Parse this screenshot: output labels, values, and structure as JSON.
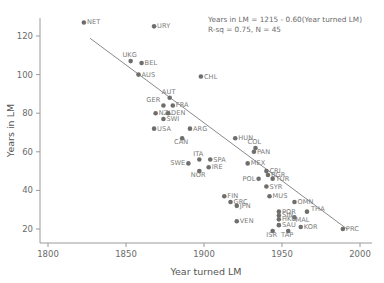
{
  "chart_data": {
    "type": "scatter",
    "title": "",
    "xlabel": "Year turned LM",
    "ylabel": "Years in LM",
    "xlim": [
      1790,
      2005
    ],
    "ylim": [
      13,
      132
    ],
    "xticks": [
      1800,
      1850,
      1900,
      1950,
      2000
    ],
    "xticklabels": [
      "1800",
      "1850",
      "1900",
      "1950",
      "2000"
    ],
    "yticks": [
      20,
      40,
      60,
      80,
      100,
      120
    ],
    "yticklabels": [
      "20",
      "40",
      "60",
      "80",
      "100",
      "120"
    ],
    "grid": false,
    "legend": null,
    "annotations": [
      "Years in LM = 1215 - 0.60(Year turned LM)",
      "R-sq = 0.75, N = 45"
    ],
    "fit_line": {
      "slope": -0.6,
      "intercept": 1215,
      "x_start": 1827,
      "x_end": 1992
    },
    "points": [
      {
        "label": "NET",
        "x": 1823,
        "y": 127,
        "lx": 3,
        "ly": 2
      },
      {
        "label": "URY",
        "x": 1868,
        "y": 125,
        "lx": 3,
        "ly": 2
      },
      {
        "label": "UKG",
        "x": 1853,
        "y": 107,
        "lx": -1,
        "ly": -4
      },
      {
        "label": "BEL",
        "x": 1860,
        "y": 106,
        "lx": 3,
        "ly": 2
      },
      {
        "label": "AUS",
        "x": 1858,
        "y": 100,
        "lx": 3,
        "ly": 2
      },
      {
        "label": "CHL",
        "x": 1898,
        "y": 99,
        "lx": 3,
        "ly": 2
      },
      {
        "label": "AUT",
        "x": 1878,
        "y": 88,
        "lx": -1,
        "ly": -4
      },
      {
        "label": "FRA",
        "x": 1880,
        "y": 84,
        "lx": 3,
        "ly": 2
      },
      {
        "label": "GER",
        "x": 1874,
        "y": 84,
        "lx": -13,
        "ly": -3
      },
      {
        "label": "NZL",
        "x": 1869,
        "y": 80,
        "lx": 3,
        "ly": 2
      },
      {
        "label": "DEN",
        "x": 1877,
        "y": 80,
        "lx": 3,
        "ly": 2
      },
      {
        "label": "SWI",
        "x": 1874,
        "y": 77,
        "lx": 3,
        "ly": 2
      },
      {
        "label": "USA",
        "x": 1868,
        "y": 72,
        "lx": 3,
        "ly": 2
      },
      {
        "label": "ARG",
        "x": 1891,
        "y": 72,
        "lx": 3,
        "ly": 2
      },
      {
        "label": "CAN",
        "x": 1886,
        "y": 67,
        "lx": -1,
        "ly": 6
      },
      {
        "label": "HUN",
        "x": 1920,
        "y": 67,
        "lx": 3,
        "ly": 2
      },
      {
        "label": "COL",
        "x": 1933,
        "y": 62,
        "lx": -1,
        "ly": -4
      },
      {
        "label": "PAN",
        "x": 1932,
        "y": 60,
        "lx": 3,
        "ly": 2
      },
      {
        "label": "ITA",
        "x": 1897,
        "y": 56,
        "lx": -1,
        "ly": -4
      },
      {
        "label": "SPA",
        "x": 1904,
        "y": 56,
        "lx": 3,
        "ly": 2
      },
      {
        "label": "SWE",
        "x": 1890,
        "y": 54,
        "lx": -13,
        "ly": 2
      },
      {
        "label": "IRE",
        "x": 1903,
        "y": 52,
        "lx": 3,
        "ly": 2
      },
      {
        "label": "NOR",
        "x": 1897,
        "y": 50,
        "lx": -1,
        "ly": 6
      },
      {
        "label": "MEX",
        "x": 1928,
        "y": 54,
        "lx": 3,
        "ly": 2
      },
      {
        "label": "CRI",
        "x": 1940,
        "y": 50,
        "lx": 3,
        "ly": 2
      },
      {
        "label": "BGR",
        "x": 1941,
        "y": 48,
        "lx": 3,
        "ly": 2
      },
      {
        "label": "POL",
        "x": 1935,
        "y": 46,
        "lx": -13,
        "ly": 2
      },
      {
        "label": "TUR",
        "x": 1944,
        "y": 46,
        "lx": 3,
        "ly": 2
      },
      {
        "label": "SYR",
        "x": 1940,
        "y": 42,
        "lx": 3,
        "ly": 2
      },
      {
        "label": "MUS",
        "x": 1942,
        "y": 37,
        "lx": 3,
        "ly": 2
      },
      {
        "label": "FIN",
        "x": 1913,
        "y": 37,
        "lx": 3,
        "ly": 2
      },
      {
        "label": "GRC",
        "x": 1917,
        "y": 34,
        "lx": 3,
        "ly": 2
      },
      {
        "label": "JPN",
        "x": 1921,
        "y": 32,
        "lx": 3,
        "ly": 2
      },
      {
        "label": "OMN",
        "x": 1958,
        "y": 34,
        "lx": 3,
        "ly": 2
      },
      {
        "label": "POR",
        "x": 1948,
        "y": 29,
        "lx": 3,
        "ly": 2
      },
      {
        "label": "THA",
        "x": 1966,
        "y": 29,
        "lx": 4,
        "ly": -1
      },
      {
        "label": "SIN",
        "x": 1948,
        "y": 27,
        "lx": 3,
        "ly": 2
      },
      {
        "label": "MAL",
        "x": 1958,
        "y": 26,
        "lx": 1,
        "ly": 5
      },
      {
        "label": "HKG",
        "x": 1948,
        "y": 25,
        "lx": 3,
        "ly": 2
      },
      {
        "label": "VEN",
        "x": 1921,
        "y": 24,
        "lx": 3,
        "ly": 2
      },
      {
        "label": "SAU",
        "x": 1948,
        "y": 22,
        "lx": 3,
        "ly": 2
      },
      {
        "label": "KOR",
        "x": 1962,
        "y": 21,
        "lx": 3,
        "ly": 2
      },
      {
        "label": "ISR",
        "x": 1944,
        "y": 19,
        "lx": -1,
        "ly": 6
      },
      {
        "label": "TAP",
        "x": 1954,
        "y": 19,
        "lx": -1,
        "ly": 6
      },
      {
        "label": "PRC",
        "x": 1989,
        "y": 20,
        "lx": 3,
        "ly": 2
      }
    ]
  }
}
